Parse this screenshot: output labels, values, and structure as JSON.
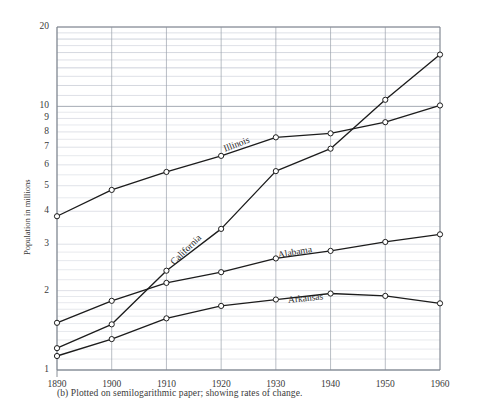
{
  "caption": "(b)  Plotted on semilogarithmic paper; showing rates of change.",
  "axis": {
    "ylabel": "Population in millions",
    "xlabel": "",
    "xticks": [
      "1890",
      "1900",
      "1910",
      "1920",
      "1930",
      "1940",
      "1950",
      "1960"
    ],
    "yticks": [
      "20",
      "10",
      "9",
      "8",
      "7",
      "6",
      "5",
      "4",
      "3",
      "2",
      "1"
    ]
  },
  "series_labels": {
    "illinois": "Illinois",
    "california": "California",
    "alabama": "Alabama",
    "arkansas": "Arkansas"
  },
  "colors": {
    "line": "#1c1c1c",
    "grid_minor": "#c9cdd6",
    "grid_major": "#9aa0ab",
    "axis": "#7d838d",
    "text": "#2a2a2a",
    "background": "#ffffff"
  },
  "chart_data": {
    "type": "line",
    "title": "",
    "subtitle": "",
    "xlabel": "",
    "ylabel": "Population in millions",
    "xscale": "linear",
    "yscale": "log",
    "xlim": [
      1890,
      1960
    ],
    "ylim": [
      1,
      20
    ],
    "grid": true,
    "legend": "inline-labels",
    "x": [
      1890,
      1900,
      1910,
      1920,
      1930,
      1940,
      1950,
      1960
    ],
    "series": [
      {
        "name": "Illinois",
        "values": [
          3.83,
          4.82,
          5.64,
          6.49,
          7.63,
          7.9,
          8.71,
          10.08
        ]
      },
      {
        "name": "California",
        "values": [
          1.21,
          1.49,
          2.38,
          3.43,
          5.68,
          6.91,
          10.59,
          15.72
        ]
      },
      {
        "name": "Alabama",
        "values": [
          1.51,
          1.83,
          2.14,
          2.35,
          2.65,
          2.83,
          3.06,
          3.27
        ]
      },
      {
        "name": "Arkansas",
        "values": [
          1.13,
          1.31,
          1.57,
          1.75,
          1.85,
          1.95,
          1.91,
          1.79
        ]
      }
    ]
  }
}
